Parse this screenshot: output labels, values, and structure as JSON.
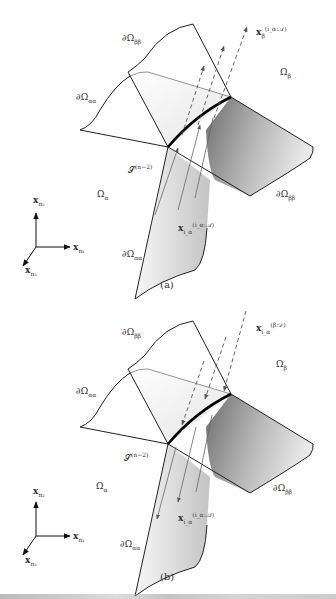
{
  "figure": {
    "panels": [
      {
        "id": "a",
        "caption": "(a)",
        "labels": {
          "boundary_beta": {
            "base": "∂Ω",
            "sub": "ββ",
            "subsub": "β"
          },
          "boundary_alpha_top": {
            "base": "∂Ω",
            "sub": "αα",
            "subsub": "α"
          },
          "boundary_alpha_bottom": {
            "base": "∂Ω",
            "sub": "αα",
            "subsub": "α"
          },
          "boundary_beta_right": {
            "base": "∂Ω",
            "sub": "ββ",
            "subsub": "β"
          },
          "omega_beta": {
            "base": "Ω",
            "sub": "β"
          },
          "omega_alpha": {
            "base": "Ω",
            "sub": "α"
          },
          "edge_set": {
            "base": "𝒮",
            "sup": "(n−2)"
          },
          "flow_beta": {
            "base": "x",
            "sub": "β",
            "sup": "(i_α:𝒜)"
          },
          "flow_alpha": {
            "base": "x",
            "sub": "i_α",
            "sup": "(i_α:𝒜)"
          }
        },
        "flow_direction": "up"
      },
      {
        "id": "b",
        "caption": "(b)",
        "labels": {
          "boundary_beta": {
            "base": "∂Ω",
            "sub": "ββ",
            "subsub": "β"
          },
          "boundary_alpha_top": {
            "base": "∂Ω",
            "sub": "αα",
            "subsub": "α"
          },
          "boundary_alpha_bottom": {
            "base": "∂Ω",
            "sub": "αα",
            "subsub": "α"
          },
          "boundary_beta_right": {
            "base": "∂Ω",
            "sub": "ββ",
            "subsub": "β"
          },
          "omega_beta": {
            "base": "Ω",
            "sub": "β"
          },
          "omega_alpha": {
            "base": "Ω",
            "sub": "α"
          },
          "edge_set": {
            "base": "𝒮",
            "sup": "(n−2)"
          },
          "flow_beta": {
            "base": "x",
            "sub": "i_α",
            "sup": "(β:𝒟)"
          },
          "flow_alpha": {
            "base": "x",
            "sub": "i_α",
            "sup": "(i_α:𝒜)"
          }
        },
        "flow_direction": "down"
      }
    ],
    "axes": {
      "x2": {
        "base": "x",
        "sub": "n₂"
      },
      "x1": {
        "base": "x",
        "sub": "n₁"
      },
      "x3": {
        "base": "x",
        "sub": "n₃"
      }
    },
    "colors": {
      "line": "#222222",
      "edge_bold": "#000000",
      "surface_light": "#f2f2f2",
      "surface_dark": "#8a8a8a",
      "arrow": "#555555"
    }
  }
}
